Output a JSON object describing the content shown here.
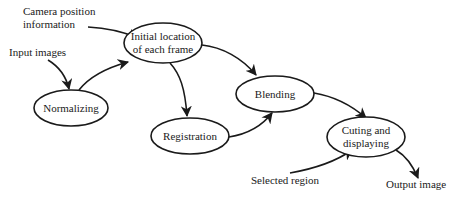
{
  "diagram": {
    "type": "flowchart",
    "nodes": [
      {
        "id": "initial",
        "lines": [
          "Initial location",
          "of each frame"
        ]
      },
      {
        "id": "normalizing",
        "lines": [
          "Normalizing"
        ]
      },
      {
        "id": "registration",
        "lines": [
          "Registration"
        ]
      },
      {
        "id": "blending",
        "lines": [
          "Blending"
        ]
      },
      {
        "id": "cutting",
        "lines": [
          "Cuting and",
          "displaying"
        ]
      }
    ],
    "inputs": {
      "camera": [
        "Camera position",
        "information"
      ],
      "input_images": "Input images",
      "selected_region": "Selected region",
      "output_image": "Output image"
    },
    "edges": [
      {
        "from": "Camera position information",
        "to": "initial"
      },
      {
        "from": "Input images",
        "to": "normalizing"
      },
      {
        "from": "normalizing",
        "to": "initial"
      },
      {
        "from": "initial",
        "to": "registration"
      },
      {
        "from": "initial",
        "to": "blending"
      },
      {
        "from": "registration",
        "to": "blending"
      },
      {
        "from": "blending",
        "to": "cutting"
      },
      {
        "from": "Selected region",
        "to": "cutting"
      },
      {
        "from": "cutting",
        "to": "Output image"
      }
    ]
  }
}
